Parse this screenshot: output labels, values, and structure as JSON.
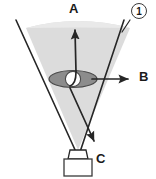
{
  "figure": {
    "number_label": "1",
    "arrow_labels": {
      "a": "A",
      "b": "B",
      "c": "C"
    },
    "colors": {
      "beam_fill": "#d8d8d8",
      "beam_fill_light": "#e8e8e8",
      "outline": "#262626",
      "object_fill": "#8a8a8a",
      "aperture_fill": "#ffffff",
      "source_fill": "#ffffff",
      "background": "#ffffff",
      "text": "#1a1a1a"
    },
    "elements": {
      "beam_cone": "light-beam-cone",
      "object_ellipse": "eye-shaped-object",
      "aperture_circle": "white-aperture",
      "source_box": "light-source-box",
      "source_neck": "source-neck",
      "arrow_a": "arrow-up-a",
      "arrow_b": "arrow-right-b",
      "arrow_c": "arrow-down-right-c"
    },
    "geometry": {
      "apex": [
        78,
        152
      ],
      "cone_left_top": [
        16,
        20
      ],
      "cone_right_top": [
        124,
        20
      ],
      "object_center": [
        73,
        79
      ],
      "arrow_a_tip": [
        75,
        26
      ],
      "arrow_b_tip": [
        131,
        79
      ],
      "arrow_c_tip": [
        96,
        144
      ]
    }
  }
}
